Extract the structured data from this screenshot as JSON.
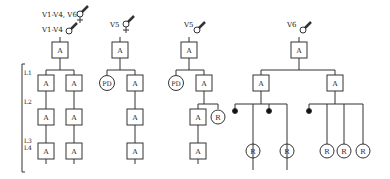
{
  "diagram": {
    "type": "pedigree",
    "levels": [
      "L1",
      "L2",
      "L3",
      "L4"
    ],
    "trees": [
      {
        "id": "V1-V4",
        "labels": [
          "V1-V4, V6",
          "V1-V4"
        ],
        "root": "A",
        "children": [
          [
            "A",
            "A",
            "A"
          ],
          [
            "A",
            "A",
            "A"
          ]
        ]
      },
      {
        "id": "V5-a",
        "labels": [
          "V5"
        ],
        "root": "A",
        "children": [
          "PD",
          [
            "A",
            "A",
            "A"
          ]
        ]
      },
      {
        "id": "V5-b",
        "labels": [
          "V5"
        ],
        "root": "A",
        "children": [
          "PD",
          [
            "A",
            "R",
            "A"
          ]
        ]
      },
      {
        "id": "V6",
        "labels": [
          "V6"
        ],
        "root": "A",
        "children": [
          "A",
          "A"
        ],
        "leaves": [
          "R",
          "R",
          "R",
          "R",
          "R"
        ]
      }
    ],
    "node_labels": {
      "a": "A",
      "pd": "PD",
      "r": "R"
    },
    "text": {
      "v1v4v6": "V1-V4, V6",
      "v1v4": "V1-V4",
      "v5a": "V5",
      "v5b": "V5",
      "v6": "V6",
      "L1": "L1",
      "L2": "L2",
      "L3": "L3",
      "L4": "L4"
    }
  }
}
